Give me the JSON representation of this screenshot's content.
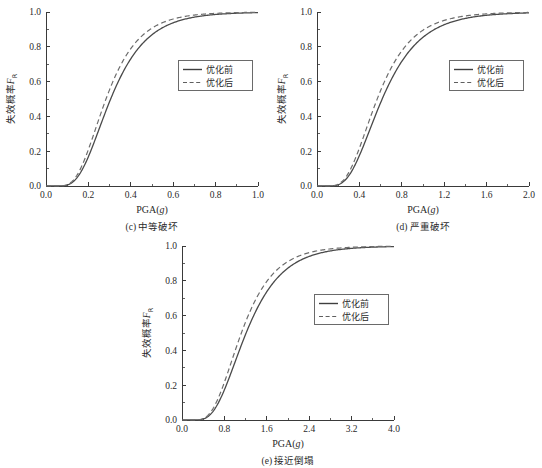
{
  "figure": {
    "panel_count": 3,
    "legend_entries": [
      {
        "label": "优化前",
        "style": "solid"
      },
      {
        "label": "优化后",
        "style": "dashed"
      }
    ]
  },
  "chart_data": [
    {
      "type": "line",
      "panel_id": "c",
      "caption": "(c) 中等破坏",
      "caption_index": "(c)",
      "caption_text": "中等破坏",
      "title": "",
      "xlabel": "PGA(g)",
      "xlabel_base": "PGA(",
      "xlabel_italic": "g",
      "xlabel_close": ")",
      "ylabel": "失效概率FR",
      "ylabel_base": "失效概率",
      "ylabel_sym": "F",
      "ylabel_sub": "R",
      "xlim": [
        0.0,
        1.0
      ],
      "ylim": [
        0.0,
        1.0
      ],
      "xticks": [
        "0.0",
        "0.2",
        "0.4",
        "0.6",
        "0.8",
        "1.0"
      ],
      "xtick_values": [
        0.0,
        0.2,
        0.4,
        0.6,
        0.8,
        1.0
      ],
      "yticks": [
        "0.0",
        "0.2",
        "0.4",
        "0.6",
        "0.8",
        "1.0"
      ],
      "ytick_values": [
        0.0,
        0.2,
        0.4,
        0.6,
        0.8,
        1.0
      ],
      "grid": false,
      "legend_position": "center-right",
      "series": [
        {
          "name": "优化前",
          "style": "solid",
          "median": 0.305,
          "beta": 0.44,
          "x": [
            0.0,
            0.05,
            0.1,
            0.12,
            0.15,
            0.18,
            0.2,
            0.22,
            0.25,
            0.28,
            0.3,
            0.32,
            0.35,
            0.38,
            0.4,
            0.45,
            0.5,
            0.55,
            0.6,
            0.65,
            0.7,
            0.8,
            0.9,
            1.0
          ],
          "y": [
            0.0,
            0.0,
            0.008,
            0.018,
            0.058,
            0.112,
            0.153,
            0.197,
            0.267,
            0.337,
            0.383,
            0.428,
            0.492,
            0.551,
            0.587,
            0.668,
            0.733,
            0.785,
            0.827,
            0.86,
            0.886,
            0.925,
            0.949,
            0.964
          ]
        },
        {
          "name": "优化后",
          "style": "dashed",
          "median": 0.283,
          "beta": 0.43,
          "x": [
            0.0,
            0.05,
            0.1,
            0.12,
            0.15,
            0.18,
            0.2,
            0.22,
            0.25,
            0.28,
            0.3,
            0.32,
            0.35,
            0.38,
            0.4,
            0.45,
            0.5,
            0.55,
            0.6,
            0.65,
            0.7,
            0.8,
            0.9,
            1.0
          ],
          "y": [
            0.0,
            0.0,
            0.014,
            0.031,
            0.088,
            0.157,
            0.207,
            0.258,
            0.337,
            0.411,
            0.459,
            0.504,
            0.567,
            0.624,
            0.658,
            0.733,
            0.792,
            0.837,
            0.872,
            0.9,
            0.921,
            0.951,
            0.969,
            0.98
          ]
        }
      ]
    },
    {
      "type": "line",
      "panel_id": "d",
      "caption": "(d) 严重破坏",
      "caption_index": "(d)",
      "caption_text": "严重破坏",
      "title": "",
      "xlabel": "PGA(g)",
      "xlabel_base": "PGA(",
      "xlabel_italic": "g",
      "xlabel_close": ")",
      "ylabel": "失效概率FR",
      "ylabel_base": "失效概率",
      "ylabel_sym": "F",
      "ylabel_sub": "R",
      "xlim": [
        0.0,
        2.0
      ],
      "ylim": [
        0.0,
        1.0
      ],
      "xticks": [
        "0.0",
        "0.4",
        "0.8",
        "1.2",
        "1.6",
        "2.0"
      ],
      "xtick_values": [
        0.0,
        0.4,
        0.8,
        1.2,
        1.6,
        2.0
      ],
      "yticks": [
        "0.0",
        "0.2",
        "0.4",
        "0.6",
        "0.8",
        "1.0"
      ],
      "ytick_values": [
        0.0,
        0.2,
        0.4,
        0.6,
        0.8,
        1.0
      ],
      "grid": false,
      "legend_position": "center-right",
      "series": [
        {
          "name": "优化前",
          "style": "solid",
          "median": 0.615,
          "beta": 0.46,
          "x": [
            0.0,
            0.1,
            0.2,
            0.25,
            0.3,
            0.35,
            0.4,
            0.45,
            0.5,
            0.55,
            0.6,
            0.65,
            0.7,
            0.8,
            0.9,
            1.0,
            1.2,
            1.4,
            1.6,
            1.8,
            2.0
          ],
          "y": [
            0.0,
            0.0,
            0.005,
            0.018,
            0.042,
            0.081,
            0.131,
            0.189,
            0.251,
            0.314,
            0.376,
            0.434,
            0.489,
            0.585,
            0.663,
            0.726,
            0.817,
            0.875,
            0.912,
            0.937,
            0.954
          ]
        },
        {
          "name": "优化后",
          "style": "dashed",
          "median": 0.568,
          "beta": 0.45,
          "x": [
            0.0,
            0.1,
            0.2,
            0.25,
            0.3,
            0.35,
            0.4,
            0.45,
            0.5,
            0.55,
            0.6,
            0.65,
            0.7,
            0.8,
            0.9,
            1.0,
            1.2,
            1.4,
            1.6,
            1.8,
            2.0
          ],
          "y": [
            0.0,
            0.0,
            0.01,
            0.031,
            0.068,
            0.121,
            0.184,
            0.251,
            0.319,
            0.384,
            0.446,
            0.503,
            0.556,
            0.646,
            0.718,
            0.775,
            0.854,
            0.903,
            0.934,
            0.954,
            0.967
          ]
        }
      ]
    },
    {
      "type": "line",
      "panel_id": "e",
      "caption": "(e) 接近倒塌",
      "caption_index": "(e)",
      "caption_text": "接近倒塌",
      "title": "",
      "xlabel": "PGA(g)",
      "xlabel_base": "PGA(",
      "xlabel_italic": "g",
      "xlabel_close": ")",
      "ylabel": "失效概率FR",
      "ylabel_base": "失效概率",
      "ylabel_sym": "F",
      "ylabel_sub": "R",
      "xlim": [
        0.0,
        4.0
      ],
      "ylim": [
        0.0,
        1.0
      ],
      "xticks": [
        "0.0",
        "0.8",
        "1.6",
        "2.4",
        "3.2",
        "4.0"
      ],
      "xtick_values": [
        0.0,
        0.8,
        1.6,
        2.4,
        3.2,
        4.0
      ],
      "yticks": [
        "0.0",
        "0.2",
        "0.4",
        "0.6",
        "0.8",
        "1.0"
      ],
      "ytick_values": [
        0.0,
        0.2,
        0.4,
        0.6,
        0.8,
        1.0
      ],
      "grid": false,
      "legend_position": "center-right",
      "series": [
        {
          "name": "优化前",
          "style": "solid",
          "median": 1.21,
          "beta": 0.44,
          "x": [
            0.0,
            0.2,
            0.4,
            0.5,
            0.6,
            0.7,
            0.8,
            0.9,
            1.0,
            1.1,
            1.2,
            1.3,
            1.4,
            1.6,
            1.8,
            2.0,
            2.4,
            2.8,
            3.2,
            3.6,
            4.0
          ],
          "y": [
            0.0,
            0.0,
            0.004,
            0.013,
            0.031,
            0.06,
            0.098,
            0.145,
            0.198,
            0.254,
            0.31,
            0.365,
            0.418,
            0.515,
            0.599,
            0.669,
            0.776,
            0.846,
            0.893,
            0.924,
            0.945
          ]
        },
        {
          "name": "优化后",
          "style": "dashed",
          "median": 1.12,
          "beta": 0.43,
          "x": [
            0.0,
            0.2,
            0.4,
            0.5,
            0.6,
            0.7,
            0.8,
            0.9,
            1.0,
            1.1,
            1.2,
            1.3,
            1.4,
            1.6,
            1.8,
            2.0,
            2.4,
            2.8,
            3.2,
            3.6,
            4.0
          ],
          "y": [
            0.0,
            0.0,
            0.008,
            0.024,
            0.053,
            0.095,
            0.147,
            0.206,
            0.269,
            0.332,
            0.393,
            0.451,
            0.505,
            0.6,
            0.678,
            0.742,
            0.836,
            0.894,
            0.93,
            0.954,
            0.969
          ]
        }
      ]
    }
  ]
}
